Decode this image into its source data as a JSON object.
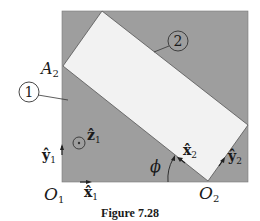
{
  "figure": {
    "caption": "Figure 7.28",
    "colors": {
      "body1_fill": "#9e9e9e",
      "body2_fill": "#f2f2f2",
      "outline": "#444444",
      "text": "#1a1a1a"
    },
    "bodies": [
      {
        "id": "1",
        "label": "1",
        "description": "gray square (body 1)"
      },
      {
        "id": "2",
        "label": "2",
        "description": "light rotated rectangle (body 2)"
      }
    ],
    "points": {
      "A2": {
        "base": "A",
        "sub": "2"
      },
      "O1": {
        "base": "O",
        "sub": "1"
      },
      "O2": {
        "base": "O",
        "sub": "2"
      }
    },
    "vectors": {
      "x1": {
        "base": "x̂",
        "sub": "1"
      },
      "y1": {
        "base": "ŷ",
        "sub": "1"
      },
      "z1": {
        "base": "ẑ",
        "sub": "1"
      },
      "x2": {
        "base": "x̂",
        "sub": "2"
      },
      "y2": {
        "base": "ŷ",
        "sub": "2"
      }
    },
    "angle": {
      "symbol": "ϕ"
    }
  }
}
